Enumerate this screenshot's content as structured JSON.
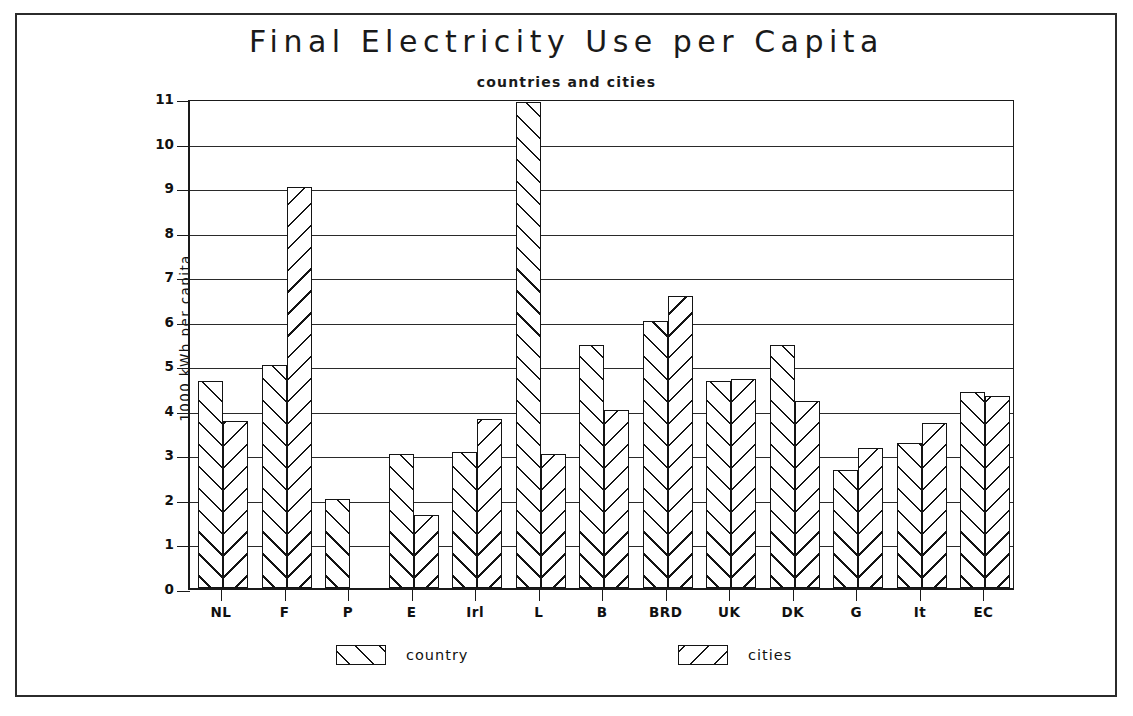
{
  "chart_data": {
    "type": "bar",
    "title": "Final Electricity Use per Capita",
    "subtitle": "countries and cities",
    "xlabel": "",
    "ylabel": "1000 kWh per capita",
    "ylim": [
      0,
      11
    ],
    "yticks": [
      0,
      1,
      2,
      3,
      4,
      5,
      6,
      7,
      8,
      9,
      10,
      11
    ],
    "grid": true,
    "legend_position": "bottom",
    "categories": [
      "NL",
      "F",
      "P",
      "E",
      "Irl",
      "L",
      "B",
      "BRD",
      "UK",
      "DK",
      "G",
      "It",
      "EC"
    ],
    "series": [
      {
        "name": "country",
        "hatch": "forward-slash",
        "values": [
          4.65,
          5.0,
          2.0,
          3.0,
          3.05,
          10.9,
          5.45,
          6.0,
          4.65,
          5.45,
          2.65,
          3.25,
          4.4
        ]
      },
      {
        "name": "cities",
        "hatch": "back-slash",
        "values": [
          3.75,
          9.0,
          null,
          1.65,
          3.8,
          3.0,
          4.0,
          6.55,
          4.7,
          4.2,
          3.15,
          3.7,
          4.3
        ]
      }
    ]
  },
  "axis": {
    "y_tick_labels": [
      "0",
      "1",
      "2",
      "3",
      "4",
      "5",
      "6",
      "7",
      "8",
      "9",
      "10",
      "11"
    ],
    "y_axis_title": "1000 kWh per capita",
    "x_tick_labels": [
      "NL",
      "F",
      "P",
      "E",
      "Irl",
      "L",
      "B",
      "BRD",
      "UK",
      "DK",
      "G",
      "It",
      "EC"
    ]
  },
  "legend": {
    "items": [
      {
        "label": "country",
        "swatch": "forward-slash-hatch-swatch"
      },
      {
        "label": "cities",
        "swatch": "back-slash-hatch-swatch"
      }
    ]
  },
  "colors": {
    "ink": "#141414",
    "paper": "#ffffff",
    "grid": "#2a2a2a"
  }
}
